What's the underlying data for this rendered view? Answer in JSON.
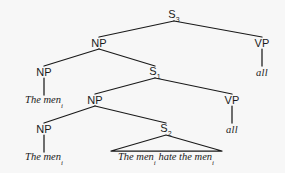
{
  "figure": {
    "type": "syntactic-tree-diagram",
    "background_color": "#f7f7f7",
    "ink_color": "#1a1a1a",
    "width": 285,
    "height": 173
  },
  "nodes": {
    "s3": {
      "label": "S",
      "subscript": "3",
      "x": 174,
      "y": 15
    },
    "np_top": {
      "label": "NP",
      "subscript": "",
      "x": 99,
      "y": 43
    },
    "vp_top": {
      "label": "VP",
      "subscript": "",
      "x": 262,
      "y": 43
    },
    "np_left_1": {
      "label": "NP",
      "subscript": "",
      "x": 44,
      "y": 72
    },
    "s1": {
      "label": "S",
      "subscript": "1",
      "x": 155,
      "y": 72
    },
    "np_mid": {
      "label": "NP",
      "subscript": "",
      "x": 95,
      "y": 100
    },
    "vp_mid": {
      "label": "VP",
      "subscript": "",
      "x": 232,
      "y": 100
    },
    "np_left_2": {
      "label": "NP",
      "subscript": "",
      "x": 44,
      "y": 129
    },
    "s2": {
      "label": "S",
      "subscript": "2",
      "x": 166,
      "y": 129
    }
  },
  "terminals": {
    "all_top": {
      "text": "all",
      "x": 262,
      "y": 72
    },
    "the_men_1": {
      "text": "The men",
      "subscript": "i",
      "x": 44,
      "y": 101
    },
    "all_mid": {
      "text": "all",
      "x": 232,
      "y": 129
    },
    "the_men_2": {
      "text": "The men",
      "subscript": "i",
      "x": 44,
      "y": 158
    },
    "clause": {
      "text_before": "The men",
      "subscript_1": "i",
      "text_middle": " hate the men",
      "subscript_2": "i",
      "full_text": "The menᵢ hate the menᵢ",
      "x": 166,
      "y": 158
    }
  },
  "edges": [
    {
      "from": "s3",
      "to": "np_top",
      "x1": 174,
      "y1": 21,
      "x2": 99,
      "y2": 37
    },
    {
      "from": "s3",
      "to": "vp_top",
      "x1": 174,
      "y1": 21,
      "x2": 262,
      "y2": 37
    },
    {
      "from": "np_top",
      "to": "np_left_1",
      "x1": 99,
      "y1": 49,
      "x2": 44,
      "y2": 66
    },
    {
      "from": "np_top",
      "to": "s1",
      "x1": 99,
      "y1": 49,
      "x2": 155,
      "y2": 66
    },
    {
      "from": "vp_top",
      "to": "all_top",
      "x1": 262,
      "y1": 49,
      "x2": 262,
      "y2": 66
    },
    {
      "from": "np_left_1",
      "to": "the_men_1",
      "x1": 44,
      "y1": 78,
      "x2": 44,
      "y2": 95
    },
    {
      "from": "s1",
      "to": "np_mid",
      "x1": 155,
      "y1": 78,
      "x2": 95,
      "y2": 94
    },
    {
      "from": "s1",
      "to": "vp_mid",
      "x1": 155,
      "y1": 78,
      "x2": 232,
      "y2": 94
    },
    {
      "from": "np_mid",
      "to": "np_left_2",
      "x1": 95,
      "y1": 106,
      "x2": 44,
      "y2": 123
    },
    {
      "from": "np_mid",
      "to": "s2",
      "x1": 95,
      "y1": 106,
      "x2": 166,
      "y2": 123
    },
    {
      "from": "vp_mid",
      "to": "all_mid",
      "x1": 232,
      "y1": 106,
      "x2": 232,
      "y2": 123
    },
    {
      "from": "np_left_2",
      "to": "the_men_2",
      "x1": 44,
      "y1": 135,
      "x2": 44,
      "y2": 152
    }
  ],
  "triangle": {
    "apex_x": 166,
    "apex_y": 135,
    "left_x": 111,
    "right_x": 222,
    "base_y": 151,
    "describes": "s2-dominates-clause"
  }
}
